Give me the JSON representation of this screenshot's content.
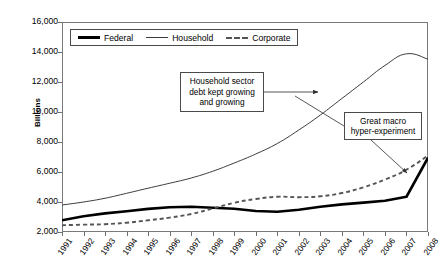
{
  "chart_data": {
    "type": "line",
    "title": "",
    "xlabel": "",
    "ylabel": "Billions",
    "ylim": [
      2000,
      16000
    ],
    "ytick_values": [
      16000,
      14000,
      12000,
      10000,
      8000,
      6000,
      4000,
      2000
    ],
    "ytick_labels": [
      "16,000",
      "14,000",
      "12,000",
      "10,000",
      "8,000",
      "6,000",
      "4,000",
      "2,000"
    ],
    "grid": false,
    "legend_position": "top-left-inside",
    "categories": [
      1991,
      1992,
      1993,
      1994,
      1995,
      1996,
      1997,
      1998,
      1999,
      2000,
      2001,
      2002,
      2003,
      2004,
      2005,
      2006,
      2007,
      2008
    ],
    "xtick_labels": [
      "1991",
      "1992",
      "1993",
      "1994",
      "1995",
      "1996",
      "1997",
      "1998",
      "1999",
      "2000",
      "2001",
      "2002",
      "2003",
      "2004",
      "2005",
      "2006",
      "2007",
      "2008"
    ],
    "series": [
      {
        "name": "Federal",
        "style": "thick-solid",
        "color": "#000000",
        "values": [
          2780,
          3050,
          3240,
          3380,
          3540,
          3650,
          3680,
          3620,
          3550,
          3400,
          3350,
          3480,
          3680,
          3840,
          3960,
          4080,
          4350,
          6950
        ]
      },
      {
        "name": "Household",
        "style": "thin-solid",
        "color": "#3b3b3b",
        "values": [
          3800,
          4000,
          4250,
          4580,
          4920,
          5250,
          5600,
          6050,
          6600,
          7200,
          7900,
          8800,
          9800,
          10900,
          12000,
          13100,
          13880,
          13520
        ]
      },
      {
        "name": "Corporate",
        "style": "dashed",
        "color": "#555555",
        "values": [
          2450,
          2490,
          2520,
          2620,
          2780,
          2960,
          3200,
          3560,
          3950,
          4200,
          4350,
          4320,
          4380,
          4600,
          4980,
          5500,
          6150,
          7100
        ]
      }
    ],
    "annotations": [
      {
        "id": "household-growth",
        "text": "Household sector debt kept growing and growing",
        "lines": [
          "Household sector",
          "debt kept growing",
          "and growing"
        ],
        "points_to": "Household series near 2003"
      },
      {
        "id": "great-macro",
        "text": "Great macro hyper-experiment",
        "lines": [
          "Great macro",
          "hyper-experiment"
        ],
        "points_to": "Federal series sharp rise in 2008"
      }
    ]
  },
  "legend": {
    "items": [
      {
        "label": "Federal",
        "swatch": "thick-solid-line-swatch"
      },
      {
        "label": "Household",
        "swatch": "thin-solid-line-swatch"
      },
      {
        "label": "Corporate",
        "swatch": "dashed-line-swatch"
      }
    ]
  },
  "axis": {
    "y_title": "Billions"
  }
}
